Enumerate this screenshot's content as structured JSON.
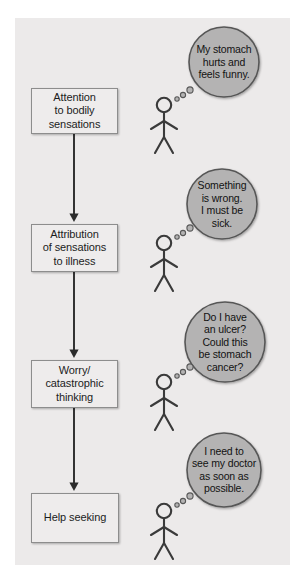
{
  "diagram": {
    "background_color": "#ffffff",
    "panel_color": "#eceaea",
    "box_fill": "#eeecec",
    "box_border": "#8d8d8d",
    "bubble_fill": "#b4b3b3",
    "bubble_border": "#575757",
    "arrow_color": "#2b2b2b",
    "figure_color": "#3a3a3a",
    "stages": [
      {
        "id": "attention",
        "label": "Attention\nto bodily\nsensations",
        "box": {
          "x": 31,
          "y": 88,
          "w": 87,
          "h": 46
        },
        "thought": "My stomach\nhurts and\nfeels funny.",
        "bubble": {
          "cx": 224,
          "cy": 62,
          "r": 35
        },
        "figure": {
          "x": 164,
          "y": 105
        },
        "tail": [
          {
            "cx": 177,
            "cy": 99,
            "r": 2.2
          },
          {
            "cx": 183,
            "cy": 95,
            "r": 2.6
          },
          {
            "cx": 190,
            "cy": 90,
            "r": 3.1
          }
        ]
      },
      {
        "id": "attribution",
        "label": "Attribution\nof sensations\nto illness",
        "box": {
          "x": 31,
          "y": 224,
          "w": 87,
          "h": 48
        },
        "thought": "Something\nis wrong.\nI must be\nsick.",
        "bubble": {
          "cx": 222,
          "cy": 204,
          "r": 35
        },
        "figure": {
          "x": 164,
          "y": 243
        },
        "tail": [
          {
            "cx": 177,
            "cy": 237,
            "r": 2.2
          },
          {
            "cx": 183,
            "cy": 233,
            "r": 2.6
          },
          {
            "cx": 190,
            "cy": 228,
            "r": 3.1
          }
        ]
      },
      {
        "id": "worry",
        "label": "Worry/\ncatastrophic\nthinking",
        "box": {
          "x": 31,
          "y": 360,
          "w": 87,
          "h": 48
        },
        "thought": "Do I have\nan ulcer?\nCould this\nbe stomach\ncancer?",
        "bubble": {
          "cx": 225,
          "cy": 342,
          "r": 40
        },
        "figure": {
          "x": 164,
          "y": 382
        },
        "tail": [
          {
            "cx": 177,
            "cy": 376,
            "r": 2.2
          },
          {
            "cx": 183,
            "cy": 372,
            "r": 2.6
          },
          {
            "cx": 190,
            "cy": 367,
            "r": 3.1
          }
        ]
      },
      {
        "id": "help-seeking",
        "label": "Help seeking",
        "box": {
          "x": 31,
          "y": 493,
          "w": 88,
          "h": 50
        },
        "thought": "I need to\nsee my doctor\nas soon as\npossible.",
        "bubble": {
          "cx": 224,
          "cy": 470,
          "r": 37
        },
        "figure": {
          "x": 164,
          "y": 511
        },
        "tail": [
          {
            "cx": 177,
            "cy": 505,
            "r": 2.2
          },
          {
            "cx": 183,
            "cy": 501,
            "r": 2.6
          },
          {
            "cx": 190,
            "cy": 496,
            "r": 3.1
          }
        ]
      }
    ],
    "arrows": [
      {
        "x": 74,
        "y1": 134,
        "y2": 222
      },
      {
        "x": 74,
        "y1": 272,
        "y2": 358
      },
      {
        "x": 74,
        "y1": 408,
        "y2": 491
      }
    ]
  }
}
